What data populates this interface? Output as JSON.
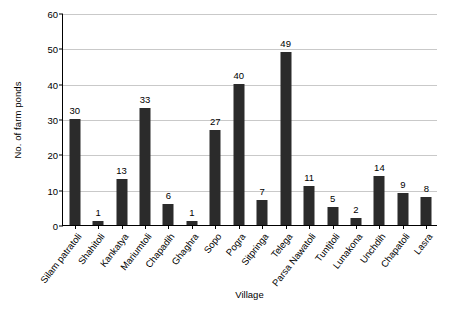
{
  "chart_data": {
    "type": "bar",
    "title": "",
    "xlabel": "Village",
    "ylabel": "No. of farm ponds",
    "categories": [
      "Silam patratoli",
      "Shahitoli",
      "Kankatya",
      "Mariumtoli",
      "Chapadih",
      "Ghaghra",
      "Sopo",
      "Pogra",
      "Sitpringa",
      "Telega",
      "Parsa Nawatoli",
      "Tuntjtoli",
      "Lunakona",
      "Unchdih",
      "Chapatoli",
      "Lasra"
    ],
    "values": [
      30,
      1,
      13,
      33,
      6,
      1,
      27,
      40,
      7,
      49,
      11,
      5,
      2,
      14,
      9,
      8
    ],
    "value_labels": [
      "30",
      "1",
      "13",
      "33",
      "6",
      "1",
      "27",
      "40",
      "7",
      "49",
      "11",
      "5",
      "2",
      "14",
      "9",
      "8"
    ],
    "ylim": [
      0,
      60
    ],
    "yticks": [
      0,
      10,
      20,
      30,
      40,
      50,
      60
    ],
    "ytick_labels": [
      "0",
      "10",
      "20",
      "30",
      "40",
      "50",
      "60"
    ],
    "grid": true,
    "legend": null,
    "bar_color": "#2b2b2b",
    "grid_color": "#c9c9c9",
    "axis_color": "#000000"
  }
}
